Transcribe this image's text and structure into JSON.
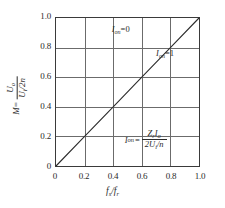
{
  "chart_data": {
    "type": "line",
    "title": "",
    "xlabel": "fs/fr",
    "ylabel": "M = Uo/(Ui/2n)",
    "xlim": [
      0,
      1.0
    ],
    "ylim": [
      0,
      1.0
    ],
    "grid": true,
    "legend_position": "none",
    "x_ticks": [
      "0",
      "0.2",
      "0.4",
      "0.6",
      "0.8",
      "1.0"
    ],
    "y_ticks": [
      "0",
      "0.2",
      "0.4",
      "0.6",
      "0.8",
      "1.0"
    ],
    "x_tick_values": [
      0,
      0.2,
      0.4,
      0.6,
      0.8,
      1.0
    ],
    "y_tick_values": [
      0,
      0.2,
      0.4,
      0.6,
      0.8,
      1.0
    ],
    "series": [
      {
        "name": "Ion=1",
        "x": [
          0,
          0.2,
          0.4,
          0.6,
          0.8,
          1.0
        ],
        "values": [
          0,
          0.2,
          0.4,
          0.6,
          0.8,
          1.0
        ]
      }
    ],
    "annotations": [
      {
        "text": "Ion=0",
        "x": 0.55,
        "y": 0.92
      },
      {
        "text": "Ion=1",
        "x": 0.84,
        "y": 0.755
      },
      {
        "text": "Ion = ZrIo / (2Ui/n)",
        "x": 0.62,
        "y": 0.155
      }
    ]
  },
  "axes": {
    "x_title": {
      "var": "f",
      "sub1": "s",
      "slash": "/",
      "var2": "f",
      "sub2": "r"
    },
    "y_title": {
      "m": "M",
      "equals": "=",
      "numerator": "U",
      "numerator_sub": "o",
      "denominator": "U",
      "denominator_sub": "i",
      "denominator_tail": "/2n"
    },
    "x_ticks": [
      {
        "label": "0",
        "value": 0
      },
      {
        "label": "0.2",
        "value": 0.2
      },
      {
        "label": "0.4",
        "value": 0.4
      },
      {
        "label": "0.6",
        "value": 0.6
      },
      {
        "label": "0.8",
        "value": 0.8
      },
      {
        "label": "1.0",
        "value": 1.0
      }
    ],
    "y_ticks": [
      {
        "label": "0",
        "value": 0
      },
      {
        "label": "0.2",
        "value": 0.2
      },
      {
        "label": "0.4",
        "value": 0.4
      },
      {
        "label": "0.6",
        "value": 0.6
      },
      {
        "label": "0.8",
        "value": 0.8
      },
      {
        "label": "1.0",
        "value": 1.0
      }
    ]
  },
  "annotations": {
    "upper": {
      "symbol": "I",
      "sub": "on",
      "equals": "=",
      "value": "0"
    },
    "on_line": {
      "symbol": "I",
      "sub": "on",
      "equals": "=",
      "value": "1"
    },
    "formula": {
      "symbol": "I",
      "sub": "on",
      "equals": "=",
      "numerator_z": "Z",
      "numerator_z_sub": "r",
      "numerator_i": "I",
      "numerator_i_sub": "o",
      "denominator_lead": "2U",
      "denominator_sub": "i",
      "denominator_tail": "/n"
    }
  },
  "style": {
    "line_color": "#2b2b2b",
    "grid_color": "#6b6b6b",
    "frame_color": "#3a3a3a",
    "text_color": "#2b2b2b",
    "background": "#ffffff"
  }
}
